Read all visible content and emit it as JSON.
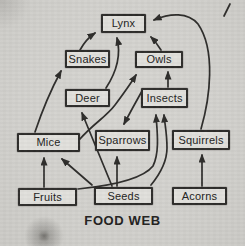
{
  "title": "FOOD WEB",
  "colors": {
    "ink": "#2e2d2b",
    "paper": "#d3d2ce",
    "box_fill": "#e1e0dc"
  },
  "nodes": [
    {
      "id": "lynx",
      "label": "Lynx",
      "x": 101,
      "y": 14,
      "w": 45,
      "h": 19
    },
    {
      "id": "snakes",
      "label": "Snakes",
      "x": 65,
      "y": 50,
      "w": 45,
      "h": 18
    },
    {
      "id": "owls",
      "label": "Owls",
      "x": 135,
      "y": 51,
      "w": 48,
      "h": 17
    },
    {
      "id": "deer",
      "label": "Deer",
      "x": 65,
      "y": 89,
      "w": 45,
      "h": 18
    },
    {
      "id": "insects",
      "label": "Insects",
      "x": 141,
      "y": 88,
      "w": 47,
      "h": 20
    },
    {
      "id": "mice",
      "label": "Mice",
      "x": 17,
      "y": 133,
      "w": 63,
      "h": 19
    },
    {
      "id": "sparrows",
      "label": "Sparrows",
      "x": 95,
      "y": 130,
      "w": 55,
      "h": 21
    },
    {
      "id": "squirrels",
      "label": "Squirrels",
      "x": 172,
      "y": 130,
      "w": 58,
      "h": 20
    },
    {
      "id": "fruits",
      "label": "Fruits",
      "x": 18,
      "y": 188,
      "w": 59,
      "h": 18
    },
    {
      "id": "seeds",
      "label": "Seeds",
      "x": 94,
      "y": 187,
      "w": 59,
      "h": 18
    },
    {
      "id": "acorns",
      "label": "Acorns",
      "x": 172,
      "y": 187,
      "w": 55,
      "h": 18
    }
  ],
  "edges": [
    {
      "from": "snakes",
      "to": "lynx",
      "d": "M 80,50 Q 86,39 95,33"
    },
    {
      "from": "deer",
      "to": "lynx",
      "d": "M 106,88 Q 123,62 117,38"
    },
    {
      "from": "owls",
      "to": "lynx",
      "d": "M 161,50 Q 156,42 151,37"
    },
    {
      "from": "squirrels",
      "to": "lynx",
      "d": "M 201,129 C 210,98 216,50 198,24 C 188,12 170,13 154,20"
    },
    {
      "from": "mice",
      "to": "snakes",
      "d": "M 35,132 Q 46,99 61,71"
    },
    {
      "from": "insects",
      "to": "owls",
      "d": "M 168,87 L 168,72"
    },
    {
      "from": "mice",
      "to": "owls",
      "d": "M 79,140 C 94,123 106,117 115,105 C 124,93 131,83 136,75"
    },
    {
      "from": "insects",
      "to": "sparrows",
      "d": "M 142,91 Q 133,107 124,124"
    },
    {
      "from": "fruits",
      "to": "mice",
      "d": "M 44,187 L 44,158"
    },
    {
      "from": "seeds",
      "to": "mice",
      "d": "M 92,185 L 62,159"
    },
    {
      "from": "seeds",
      "to": "sparrows",
      "d": "M 117,186 L 117,157"
    },
    {
      "from": "seeds",
      "to": "deer",
      "d": "M 112,186 L 82,113"
    },
    {
      "from": "fruits",
      "to": "insects",
      "d": "M 78,189 C 108,186 142,180 153,166 C 160,152 157,130 156,115"
    },
    {
      "from": "seeds",
      "to": "insects",
      "d": "M 151,185 C 160,174 167,160 167,148 C 167,133 165,126 164,115"
    },
    {
      "from": "acorns",
      "to": "squirrels",
      "d": "M 202,186 L 202,155"
    }
  ]
}
